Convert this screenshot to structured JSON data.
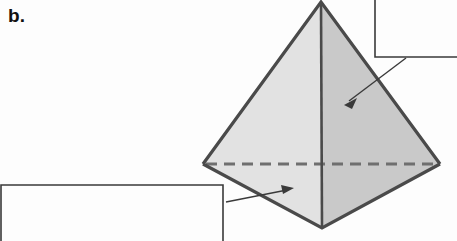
{
  "figure": {
    "panel_label": "b.",
    "background_color": "#fdfdfd",
    "shape": {
      "name": "tetrahedron",
      "outline_color": "#4a4a4a",
      "outline_width": 3,
      "left_face_color": "#e2e2e2",
      "right_face_color": "#c9c9c9",
      "hidden_edge_style": "dashed",
      "hidden_edge_color": "#6f6f6f",
      "vertices": {
        "apex": [
          321,
          2
        ],
        "left": [
          203,
          164
        ],
        "right": [
          440,
          164
        ],
        "bottom": [
          322,
          228
        ]
      }
    },
    "callouts": [
      {
        "id": "top-right",
        "label": "",
        "box": [
          375,
          -20,
          457,
          57
        ],
        "leader_start": [
          406,
          58
        ],
        "leader_end": [
          345,
          104
        ],
        "arrow": "down-left",
        "target": "right-face"
      },
      {
        "id": "bottom-left",
        "label": "",
        "box": [
          1,
          185,
          223,
          241
        ],
        "leader_start": [
          226,
          202
        ],
        "leader_end": [
          293,
          188
        ],
        "arrow": "up-right",
        "target": "left-face-lower"
      }
    ],
    "line_color": "#3a3a3a"
  }
}
